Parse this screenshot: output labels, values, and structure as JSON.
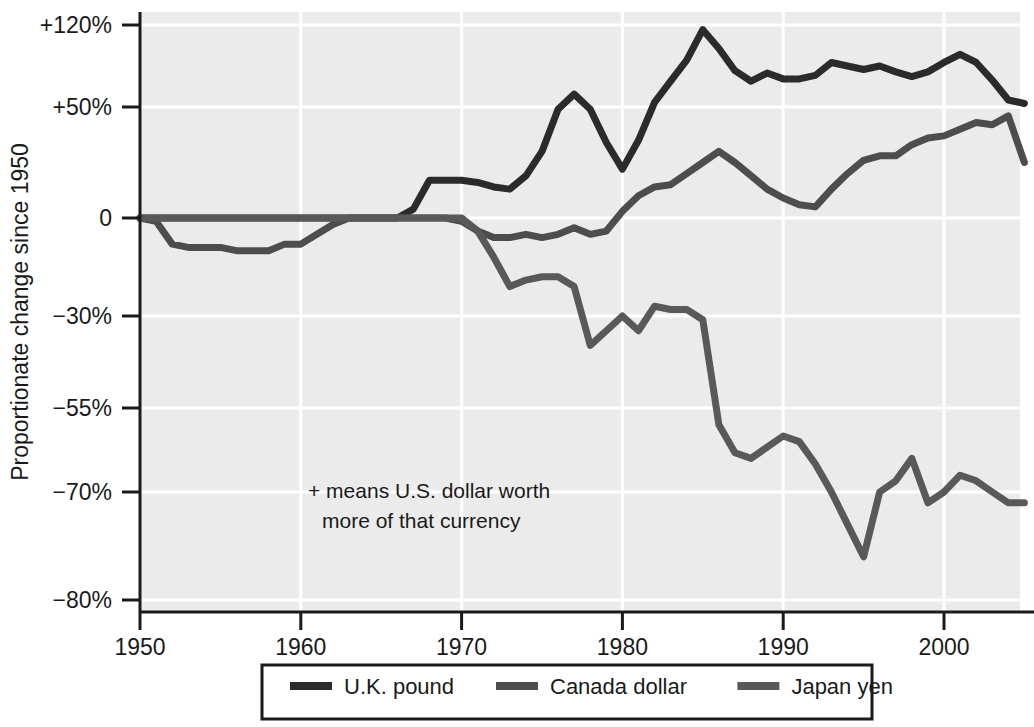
{
  "chart_data": {
    "type": "line",
    "title": "",
    "xlabel": "",
    "ylabel": "Proportionate change since 1950",
    "annotation_line1": "+ means U.S. dollar worth",
    "annotation_line2": "more of that currency",
    "grid": true,
    "legend_position": "bottom",
    "xlim": [
      1950,
      2005
    ],
    "x_ticks": [
      1950,
      1960,
      1970,
      1980,
      1990,
      2000
    ],
    "x_tick_labels": [
      "1950",
      "1960",
      "1970",
      "1980",
      "1990",
      "2000"
    ],
    "y_ticks": [
      120,
      50,
      0,
      -30,
      -55,
      -70,
      -80
    ],
    "y_tick_labels": [
      "+120%",
      "+50%",
      "0",
      "−30%",
      "−55%",
      "−70%",
      "−80%"
    ],
    "y_axis_note": "non-linear (piecewise) scale",
    "plot_bg_color": "#ebebeb",
    "grid_color": "#ffffff",
    "axis_color": "#1a1a1a",
    "x": [
      1950,
      1951,
      1952,
      1953,
      1954,
      1955,
      1956,
      1957,
      1958,
      1959,
      1960,
      1961,
      1962,
      1963,
      1964,
      1965,
      1966,
      1967,
      1968,
      1969,
      1970,
      1971,
      1972,
      1973,
      1974,
      1975,
      1976,
      1977,
      1978,
      1979,
      1980,
      1981,
      1982,
      1983,
      1984,
      1985,
      1986,
      1987,
      1988,
      1989,
      1990,
      1991,
      1992,
      1993,
      1994,
      1995,
      1996,
      1997,
      1998,
      1999,
      2000,
      2001,
      2002,
      2003,
      2004,
      2005
    ],
    "series": [
      {
        "name": "U.K. pound",
        "color": "#2b2b2b",
        "width": 7,
        "values": [
          0,
          0,
          0,
          0,
          0,
          0,
          0,
          0,
          0,
          0,
          0,
          0,
          0,
          0,
          0,
          0,
          0,
          4,
          17,
          17,
          17,
          16,
          14,
          13,
          19,
          30,
          49,
          61,
          49,
          34,
          22,
          35,
          54,
          72,
          90,
          116,
          100,
          81,
          72,
          79,
          74,
          74,
          77,
          88,
          85,
          82,
          85,
          80,
          76,
          80,
          88,
          95,
          88,
          73,
          56,
          53
        ]
      },
      {
        "name": "Canada dollar",
        "color": "#4d4d4d",
        "width": 7,
        "values": [
          0,
          -1,
          -8,
          -9,
          -9,
          -9,
          -10,
          -10,
          -10,
          -8,
          -8,
          -5,
          -2,
          0,
          0,
          0,
          0,
          0,
          0,
          0,
          -1,
          -4,
          -6,
          -6,
          -5,
          -6,
          -5,
          -3,
          -5,
          -4,
          3,
          10,
          14,
          15,
          20,
          25,
          30,
          25,
          19,
          13,
          9,
          6,
          5,
          13,
          20,
          26,
          28,
          28,
          33,
          36,
          37,
          40,
          43,
          42,
          46,
          25
        ]
      },
      {
        "name": "Japan yen",
        "color": "#595959",
        "width": 7,
        "values": [
          0,
          0,
          0,
          0,
          0,
          0,
          0,
          0,
          0,
          0,
          0,
          0,
          0,
          0,
          0,
          0,
          0,
          0,
          0,
          0,
          0,
          -4,
          -12,
          -21,
          -19,
          -18,
          -18,
          -21,
          -38,
          -34,
          -30,
          -34,
          -27,
          -28,
          -28,
          -31,
          -58,
          -63,
          -64,
          -62,
          -60,
          -61,
          -65,
          -70,
          -73,
          -76,
          -70,
          -68,
          -64,
          -71,
          -70,
          -67,
          -68,
          -70,
          -71,
          -71
        ]
      }
    ]
  },
  "legend": {
    "items": [
      {
        "label": "U.K. pound",
        "color": "#2b2b2b"
      },
      {
        "label": "Canada dollar",
        "color": "#4d4d4d"
      },
      {
        "label": "Japan yen",
        "color": "#595959"
      }
    ]
  }
}
